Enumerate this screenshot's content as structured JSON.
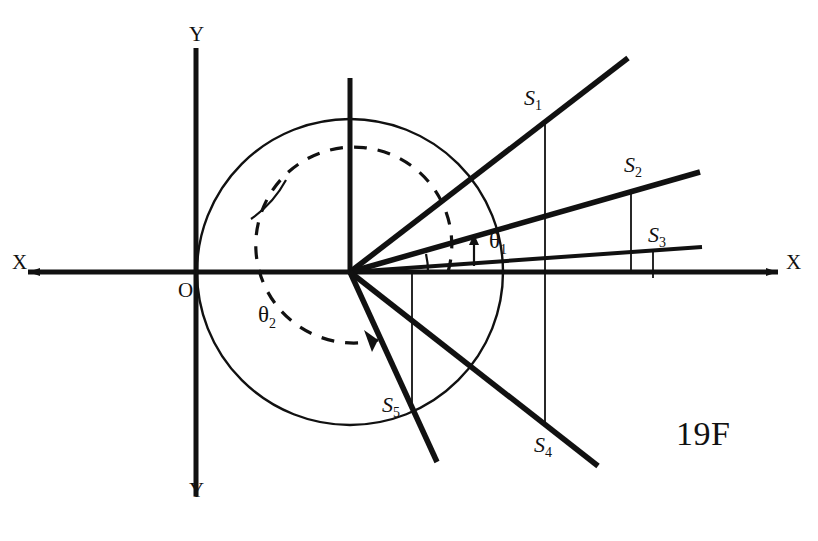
{
  "figure": {
    "caption": "19F",
    "caption_x": 676,
    "caption_y": 415,
    "background_color": "#ffffff",
    "ink_color": "#111111"
  },
  "axes": {
    "x_label_left": "X",
    "x_label_right": "X",
    "y_label_top": "Y",
    "y_label_bottom": "Y",
    "origin_label": "O",
    "origin_x": 196,
    "origin_y": 272,
    "x_axis": {
      "x1": 28,
      "y1": 272,
      "x2": 778,
      "y2": 272
    },
    "y_axis": {
      "x1": 196,
      "y1": 48,
      "x2": 196,
      "y2": 496
    },
    "label_positions": {
      "x_left": {
        "x": 12,
        "y": 261
      },
      "x_right": {
        "x": 786,
        "y": 261
      },
      "y_top": {
        "x": 189,
        "y": 22
      },
      "y_bottom": {
        "x": 189,
        "y": 488
      },
      "origin": {
        "x": 178,
        "y": 281
      }
    }
  },
  "vertex": {
    "name": "ray-origin-vertex",
    "x": 350,
    "y": 272,
    "stem": {
      "x1": 350,
      "y1": 78,
      "x2": 350,
      "y2": 272
    }
  },
  "circle": {
    "name": "unit-circle",
    "cx": 350,
    "cy": 272,
    "r": 153,
    "stroke_width": 2.4
  },
  "rays": [
    {
      "id": "ray-s1",
      "point_label": "S",
      "point_subscript": "1",
      "point_x": 545,
      "point_y": 122,
      "end_x": 628,
      "end_y": 58,
      "label_x": 524,
      "label_y": 85,
      "width": 5.5
    },
    {
      "id": "ray-s2",
      "point_label": "S",
      "point_subscript": "2",
      "point_x": 631,
      "point_y": 190,
      "end_x": 700,
      "end_y": 172,
      "label_x": 624,
      "label_y": 152,
      "width": 5.5
    },
    {
      "id": "ray-s3",
      "point_label": "S",
      "point_subscript": "3",
      "point_x": 653,
      "point_y": 258,
      "end_x": 702,
      "end_y": 247,
      "label_x": 648,
      "label_y": 222,
      "width": 4
    },
    {
      "id": "ray-s4",
      "point_label": "S",
      "point_subscript": "4",
      "point_x": 545,
      "point_y": 425,
      "end_x": 598,
      "end_y": 466,
      "label_x": 534,
      "label_y": 432,
      "width": 5.5
    },
    {
      "id": "ray-s5",
      "point_label": "S",
      "point_subscript": "5",
      "point_x": 412,
      "point_y": 407,
      "end_x": 437,
      "end_y": 462,
      "label_x": 382,
      "label_y": 392,
      "width": 5.5
    }
  ],
  "drop_lines": [
    {
      "id": "drop-s1",
      "x": 545,
      "y_top": 122,
      "y_bottom": 272
    },
    {
      "id": "drop-s2",
      "x": 631,
      "y_top": 190,
      "y_bottom": 272
    },
    {
      "id": "drop-s3",
      "x": 653,
      "y_top": 258,
      "y_bottom": 272
    },
    {
      "id": "drop-s4",
      "x": 545,
      "y_top": 272,
      "y_bottom": 425
    },
    {
      "id": "drop-s5",
      "x": 412,
      "y_top": 272,
      "y_bottom": 407
    }
  ],
  "angles": [
    {
      "id": "theta1",
      "label": "θ",
      "subscript": "1",
      "label_x": 489,
      "label_y": 228,
      "description": "angle between shallow ray and second ray",
      "marker_x": 474,
      "marker_y_top": 239,
      "marker_y_bottom": 266
    },
    {
      "id": "theta2",
      "label": "θ",
      "subscript": "2",
      "label_x": 258,
      "label_y": 302,
      "description": "reflex angle measured counterclockwise to lower-left ray",
      "arc_radius": 98
    }
  ],
  "small_arcs": [
    {
      "id": "arc-upper-ray-marker",
      "cx": 350,
      "cy": 272,
      "r": 112,
      "start_deg": 125,
      "end_deg": 152
    },
    {
      "id": "arc-shallow-pair-marker",
      "cx": 350,
      "cy": 272,
      "r": 78,
      "start_deg": 180,
      "end_deg": 193
    }
  ]
}
